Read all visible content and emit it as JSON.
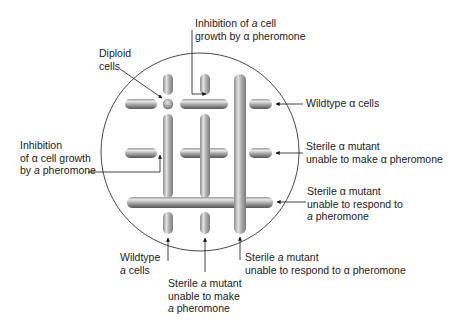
{
  "figure": {
    "plate": {
      "cx": 200,
      "cy": 152,
      "r": 99,
      "stroke": "#333333"
    },
    "streak_color_light": "#d8d8d8",
    "streak_color_dark": "#6e6e6e"
  },
  "labels": {
    "top_center": {
      "line1": "Inhibition of ",
      "line1_italic": "a",
      "line1_end": " cell",
      "line2": "growth by α pheromone"
    },
    "diploid": {
      "line1": "Diploid",
      "line2": "cells"
    },
    "left": {
      "line1": "Inhibition",
      "line2": "of α cell growth",
      "line3_start": "by ",
      "line3_italic": "a",
      "line3_end": " pheromone"
    },
    "right_1": {
      "line1": "Wildtype α cells"
    },
    "right_2": {
      "line1": "Sterile α mutant",
      "line2": "unable to make α pheromone"
    },
    "right_3": {
      "line1": "Sterile α mutant",
      "line2": "unable to respond to",
      "line3_italic": "a",
      "line3_end": " pheromone"
    },
    "bottom_left": {
      "line1": "Wildtype",
      "line2_italic": "a",
      "line2_end": " cells"
    },
    "bottom_center": {
      "line1_start": "Sterile ",
      "line1_italic": "a",
      "line1_end": " mutant",
      "line2": "unable to make",
      "line3_italic": "a",
      "line3_end": " pheromone"
    },
    "bottom_right": {
      "line1_start": "Sterile ",
      "line1_italic": "a",
      "line1_end": " mutant",
      "line2": "unable to respond to α pheromone"
    }
  }
}
